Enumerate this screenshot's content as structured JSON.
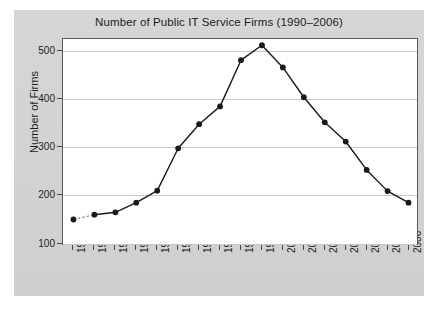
{
  "chart_data": {
    "type": "line",
    "title": "Number of Public IT Service Firms (1990–2006)",
    "xlabel": "",
    "ylabel": "Number of Firms",
    "categories": [
      "1990",
      "1991",
      "1992",
      "1993",
      "1994",
      "1995",
      "1996",
      "1997",
      "1998",
      "1999",
      "2000",
      "2001",
      "2002",
      "2003",
      "2004",
      "2005",
      "2006"
    ],
    "values": [
      150,
      160,
      165,
      185,
      210,
      298,
      348,
      385,
      481,
      512,
      466,
      404,
      352,
      312,
      253,
      209,
      185
    ],
    "ylim": [
      95,
      525
    ],
    "yticks": [
      100,
      200,
      300,
      400,
      500
    ],
    "ytick_labels": [
      "100",
      "200",
      "300",
      "400",
      "500"
    ],
    "grid": true,
    "legend": null,
    "marker": "filled-circle",
    "line_color": "#1a1a1a",
    "plot_bg": "#ffffff",
    "figure_bg": "#d4d4d4",
    "grid_color": "#c9c9c9"
  },
  "figure": {
    "title": "Number of Public IT Service Firms (1990–2006)",
    "ylabel": "Number of Firms"
  }
}
